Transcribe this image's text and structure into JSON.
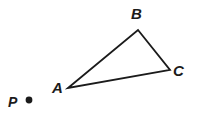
{
  "figure": {
    "type": "geometry-diagram",
    "background_color": "#ffffff",
    "stroke_color": "#1b1b1b",
    "stroke_width": 1.8,
    "labels": {
      "a": "A",
      "b": "B",
      "c": "C",
      "p": "P"
    },
    "triangle": {
      "name": "triangle-ABC",
      "vertices": [
        {
          "name": "A",
          "x": 68,
          "y": 88
        },
        {
          "name": "B",
          "x": 138,
          "y": 30
        },
        {
          "name": "C",
          "x": 170,
          "y": 70
        }
      ],
      "path": "M 68 88 L 138 30 L 170 70 Z"
    },
    "point": {
      "name": "P",
      "x": 29,
      "y": 100,
      "radius": 3.4,
      "fill": "#1b1b1b"
    }
  }
}
